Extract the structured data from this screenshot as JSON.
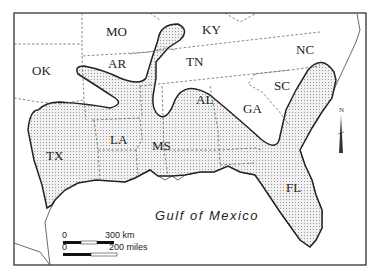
{
  "map": {
    "type": "regional map",
    "region": "Southeastern United States",
    "states": [
      {
        "code": "MO",
        "x": 106,
        "y": 36
      },
      {
        "code": "KY",
        "x": 202,
        "y": 34
      },
      {
        "code": "OK",
        "x": 32,
        "y": 75
      },
      {
        "code": "AR",
        "x": 108,
        "y": 68
      },
      {
        "code": "TN",
        "x": 196,
        "y": 66
      },
      {
        "code": "NC",
        "x": 300,
        "y": 54
      },
      {
        "code": "SC",
        "x": 275,
        "y": 89
      },
      {
        "code": "GA",
        "x": 246,
        "y": 111
      },
      {
        "code": "AL",
        "x": 196,
        "y": 104
      },
      {
        "code": "LA",
        "x": 116,
        "y": 144
      },
      {
        "code": "MS",
        "x": 155,
        "y": 148
      },
      {
        "code": "TX",
        "x": 48,
        "y": 160
      },
      {
        "code": "FL",
        "x": 289,
        "y": 191
      }
    ],
    "water_label": "Gulf of Mexico",
    "shaded_region": "stippled zone",
    "colors": {
      "frame": "#333333",
      "boundary": "#555555",
      "shade": "#bdbdbd",
      "outline": "#222222"
    }
  },
  "scale_bar": {
    "km_zero": "0",
    "km_label": "300 km",
    "mi_zero": "0",
    "mi_label": "200 miles"
  },
  "north_arrow": {
    "label": "N"
  }
}
